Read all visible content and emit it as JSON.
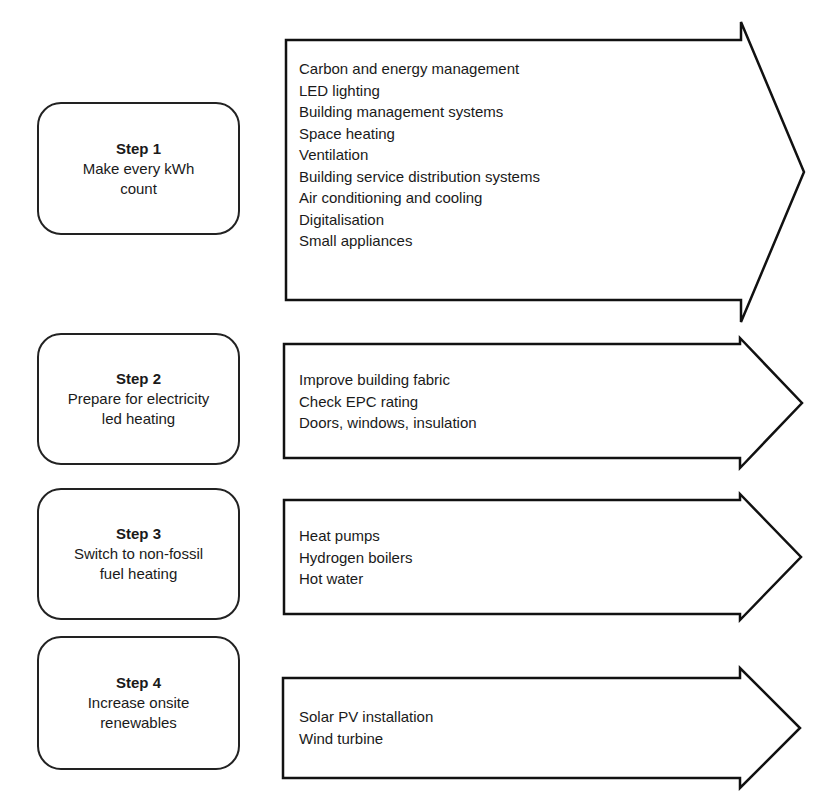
{
  "diagram": {
    "type": "step-process-flow",
    "steps": [
      {
        "title": "Step 1",
        "description": "Make every kWh\ncount",
        "items": [
          "Carbon and energy management",
          "LED lighting",
          "Building management systems",
          "Space heating",
          "Ventilation",
          "Building service distribution systems",
          "Air conditioning and cooling",
          "Digitalisation",
          "Small appliances"
        ]
      },
      {
        "title": "Step 2",
        "description": "Prepare for electricity\nled heating",
        "items": [
          "Improve building fabric",
          "Check EPC rating",
          "Doors, windows, insulation"
        ]
      },
      {
        "title": "Step 3",
        "description": "Switch to non-fossil\nfuel heating",
        "items": [
          "Heat pumps",
          "Hydrogen boilers",
          "Hot water"
        ]
      },
      {
        "title": "Step 4",
        "description": "Increase onsite\nrenewables",
        "items": [
          "Solar PV installation",
          "Wind turbine"
        ]
      }
    ],
    "colors": {
      "stroke": "#111111",
      "background": "#ffffff",
      "text": "#1a1a1a"
    }
  }
}
